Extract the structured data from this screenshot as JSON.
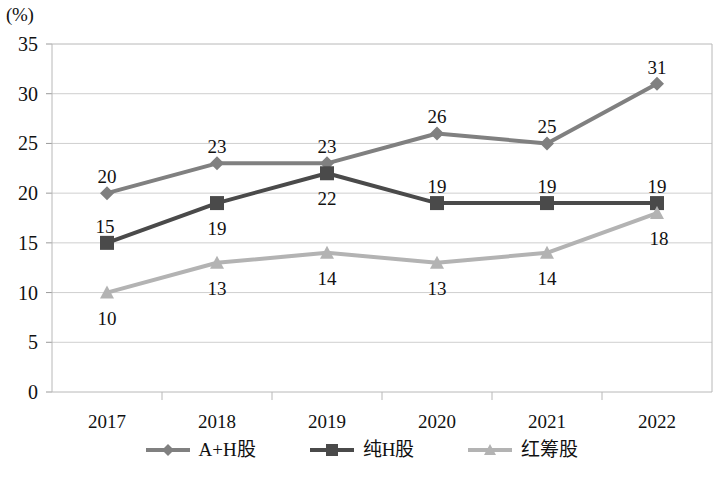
{
  "chart_data": {
    "type": "line",
    "title": "",
    "xlabel": "",
    "ylabel": "(%)",
    "categories": [
      "2017",
      "2018",
      "2019",
      "2020",
      "2021",
      "2022"
    ],
    "ylim": [
      0,
      35
    ],
    "yticks": [
      "0",
      "5",
      "10",
      "15",
      "20",
      "25",
      "30",
      "35"
    ],
    "grid": true,
    "legend_position": "bottom",
    "series": [
      {
        "name": "A+H股",
        "marker": "diamond",
        "color": "#808080",
        "values": [
          20,
          23,
          23,
          26,
          25,
          31
        ],
        "labels": [
          "20",
          "23",
          "23",
          "26",
          "25",
          "31"
        ]
      },
      {
        "name": "纯H股",
        "marker": "square",
        "color": "#4a4a4a",
        "values": [
          15,
          19,
          22,
          19,
          19,
          19
        ],
        "labels": [
          "15",
          "19",
          "22",
          "19",
          "19",
          "19"
        ]
      },
      {
        "name": "红筹股",
        "marker": "triangle",
        "color": "#b3b3b3",
        "values": [
          10,
          13,
          14,
          13,
          14,
          18
        ],
        "labels": [
          "10",
          "13",
          "14",
          "13",
          "14",
          "18"
        ]
      }
    ]
  },
  "axis": {
    "unit_label": "(%)"
  },
  "legend": {
    "items": [
      {
        "label": "A+H股",
        "marker": "diamond-marker",
        "color": "#808080"
      },
      {
        "label": "纯H股",
        "marker": "square-marker",
        "color": "#4a4a4a"
      },
      {
        "label": "红筹股",
        "marker": "triangle-marker",
        "color": "#b3b3b3"
      }
    ]
  }
}
